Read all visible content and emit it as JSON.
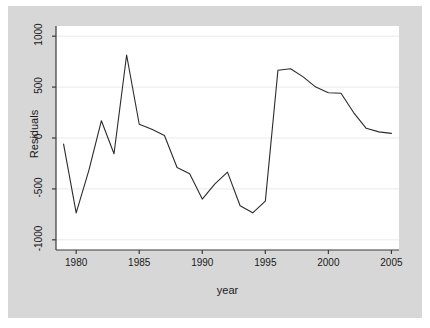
{
  "chart_data": {
    "type": "line",
    "title": "",
    "subtitle": "",
    "xlabel": "year",
    "ylabel": "Residuals",
    "xlim": [
      1978.4,
      2005.6
    ],
    "ylim": [
      -1100,
      1100
    ],
    "xticks": [
      1980,
      1985,
      1990,
      1995,
      2000,
      2005
    ],
    "yticks": [
      1000,
      500,
      0,
      -500,
      -1000
    ],
    "xtick_labels": [
      "1980",
      "1985",
      "1990",
      "1995",
      "2000",
      "2005"
    ],
    "ytick_labels": [
      "1000",
      "500",
      "0",
      "-500",
      "-1000"
    ],
    "grid": true,
    "grid_axis": "y",
    "legend": false,
    "legend_position": "none",
    "line_color": "#2b2b2b",
    "grid_color": "#e9e9e9",
    "plot_bg": "#ffffff",
    "figure_bg": "#d7d7d7",
    "page_bg": "#ffffff",
    "x": [
      1979,
      1980,
      1981,
      1982,
      1983,
      1984,
      1985,
      1986,
      1987,
      1988,
      1989,
      1990,
      1991,
      1992,
      1993,
      1994,
      1995,
      1996,
      1997,
      1998,
      1999,
      2000,
      2001,
      2002,
      2003,
      2004,
      2005
    ],
    "values": [
      -60,
      -735,
      -320,
      170,
      -155,
      815,
      135,
      85,
      25,
      -290,
      -350,
      -600,
      -450,
      -335,
      -665,
      -735,
      -620,
      665,
      680,
      600,
      500,
      445,
      440,
      250,
      95,
      60,
      45
    ],
    "series": [
      {
        "name": "Residuals",
        "values": [
          -60,
          -735,
          -320,
          170,
          -155,
          815,
          135,
          85,
          25,
          -290,
          -350,
          -600,
          -450,
          -335,
          -665,
          -735,
          -620,
          665,
          680,
          600,
          500,
          445,
          440,
          250,
          95,
          60,
          45
        ]
      }
    ]
  },
  "axes": {
    "y_axis_label": "Residuals",
    "x_axis_label": "year"
  }
}
